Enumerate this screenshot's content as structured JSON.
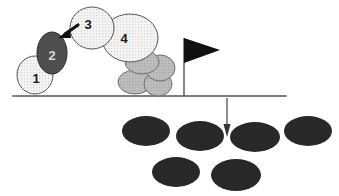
{
  "diagram": {
    "type": "schematic-illustration",
    "ground_line": {
      "name": "ground-line",
      "x1": 13,
      "y1": 96,
      "x2": 286,
      "y2": 96,
      "color": "#555555",
      "width": 1.4
    },
    "numbered_blobs": [
      {
        "label": "1",
        "name": "blob-1",
        "shape": "ellipse",
        "cx": 35,
        "cy": 75,
        "rx": 18,
        "ry": 19,
        "fill": "#f2f2f2",
        "stroke": "#555555",
        "texture": "stipple",
        "label_color": "#1a1a1a",
        "label_x": 36,
        "label_y": 78
      },
      {
        "label": "2",
        "name": "blob-2",
        "shape": "ellipse",
        "cx": 52,
        "cy": 53,
        "rx": 15,
        "ry": 21,
        "fill": "#4a4a4a",
        "stroke": "#2b2b2b",
        "texture": "stipple-dark",
        "label_color": "#d8d8d8",
        "label_x": 52,
        "label_y": 55
      },
      {
        "label": "3",
        "name": "blob-3",
        "shape": "ellipse",
        "cx": 92,
        "cy": 28,
        "rx": 22,
        "ry": 21,
        "fill": "#f2f2f2",
        "stroke": "#555555",
        "texture": "stipple",
        "label_color": "#1a1a1a",
        "label_x": 88,
        "label_y": 24
      },
      {
        "label": "4",
        "name": "blob-4",
        "shape": "ellipse",
        "cx": 130,
        "cy": 38,
        "rx": 28,
        "ry": 24,
        "fill": "#eeeeee",
        "stroke": "#555555",
        "texture": "stipple",
        "label_color": "#1a1a1a",
        "label_x": 124,
        "label_y": 38
      }
    ],
    "gray_cluster": {
      "name": "gray-debris-cluster",
      "fill": "#b8b8b8",
      "stroke": "#6e6e6e",
      "texture": "stipple-mid",
      "blobs": [
        {
          "name": "gray-blob-a",
          "cx": 142,
          "cy": 62,
          "rx": 17,
          "ry": 12
        },
        {
          "name": "gray-blob-b",
          "cx": 160,
          "cy": 68,
          "rx": 15,
          "ry": 13
        },
        {
          "name": "gray-blob-c",
          "cx": 135,
          "cy": 82,
          "rx": 17,
          "ry": 12
        },
        {
          "name": "gray-blob-d",
          "cx": 158,
          "cy": 84,
          "rx": 14,
          "ry": 12
        }
      ]
    },
    "impact_arrow": {
      "name": "impact-arrow",
      "description": "short thick arrow from blob 3 pointing down-left to blob 2",
      "x1": 77,
      "y1": 26,
      "x2": 62,
      "y2": 36,
      "color": "#111111",
      "width": 3.2,
      "head_size": 6
    },
    "flag": {
      "name": "flag-marker",
      "pole": {
        "x": 184,
        "y_top": 38,
        "y_bottom": 96,
        "color": "#555555",
        "width": 1.4
      },
      "banner": {
        "points": "184,38 184,63 220,50",
        "fill": "#111111",
        "description": "black right-pointing triangular pennant"
      }
    },
    "drop_arrow": {
      "name": "drop-arrow",
      "description": "thin vertical arrow pointing down from ground line into debris field",
      "x": 227,
      "y_top": 98,
      "y_bottom": 136,
      "color": "#333333",
      "width": 1.1,
      "head_width": 7,
      "head_length": 13
    },
    "dark_field": {
      "name": "dark-debris-field",
      "fill": "#262626",
      "stroke": "#262626",
      "count": 6,
      "rows": [
        {
          "name": "dark-row-top",
          "blobs": [
            {
              "name": "dark-blob-1",
              "cx": 146,
              "cy": 131,
              "rx": 24,
              "ry": 15
            },
            {
              "name": "dark-blob-2",
              "cx": 200,
              "cy": 136,
              "rx": 24,
              "ry": 15
            },
            {
              "name": "dark-blob-3",
              "cx": 255,
              "cy": 137,
              "rx": 25,
              "ry": 15
            },
            {
              "name": "dark-blob-4",
              "cx": 308,
              "cy": 131,
              "rx": 24,
              "ry": 15
            }
          ]
        },
        {
          "name": "dark-row-bottom",
          "blobs": [
            {
              "name": "dark-blob-5",
              "cx": 176,
              "cy": 172,
              "rx": 24,
              "ry": 15
            },
            {
              "name": "dark-blob-6",
              "cx": 236,
              "cy": 175,
              "rx": 25,
              "ry": 16
            }
          ]
        }
      ]
    },
    "colors": {
      "background": "#ffffff",
      "light_blob": "#f2f2f2",
      "dark_blob": "#4a4a4a",
      "mid_gray_blob": "#b8b8b8",
      "dark_field_blob": "#262626",
      "line": "#555555",
      "ink": "#111111"
    }
  }
}
